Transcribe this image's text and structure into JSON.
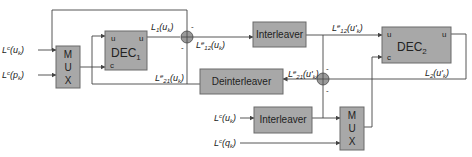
{
  "blocks": {
    "mux1": {
      "letters": [
        "M",
        "U",
        "X"
      ]
    },
    "dec1": {
      "name": "DEC",
      "sub": "1",
      "port_u_in": "u",
      "port_u_out": "u",
      "port_c": "c"
    },
    "interleaver_top": {
      "label": "Interleaver"
    },
    "deinterleaver": {
      "label": "Deinterleaver"
    },
    "dec2": {
      "name": "DEC",
      "sub": "2",
      "port_u_in": "u",
      "port_u_out": "u",
      "port_c": "c"
    },
    "interleaver_bottom": {
      "label": "Interleaver"
    },
    "mux2": {
      "letters": [
        "M",
        "U",
        "X"
      ]
    }
  },
  "signals": {
    "in_uk": {
      "base": "L",
      "sup": "c",
      "arg": "(u",
      "argsub": "k",
      "close": ")"
    },
    "in_pk": {
      "base": "L",
      "sup": "c",
      "arg": "(p",
      "argsub": "k",
      "close": ")"
    },
    "L1": {
      "base": "L",
      "sub": "1",
      "arg": "(u",
      "argsub": "k",
      "close": ")"
    },
    "Le12": {
      "base": "L",
      "sup": "e",
      "sub": "12",
      "arg": "(u",
      "argsub": "k",
      "close": ")"
    },
    "Le21": {
      "base": "L",
      "sup": "e",
      "sub": "21",
      "arg": "(u",
      "argsub": "k",
      "close": ")"
    },
    "Le12p": {
      "base": "L",
      "sup": "e",
      "sub": "12",
      "arg": "(u'",
      "argsub": "k",
      "close": ")"
    },
    "Le21p": {
      "base": "L",
      "sup": "e",
      "sub": "21",
      "arg": "(u'",
      "argsub": "k",
      "close": ")"
    },
    "L2": {
      "base": "L",
      "sub": "2",
      "arg": "(u'",
      "argsub": "k",
      "close": ")"
    },
    "in2_uk": {
      "base": "L",
      "sup": "c",
      "arg": "(u",
      "argsub": "k",
      "close": ")"
    },
    "in2_qk": {
      "base": "L",
      "sup": "c",
      "arg": "(q",
      "argsub": "k",
      "close": ")"
    }
  },
  "summers": {
    "sum1": {
      "signs": [
        "-",
        "-"
      ]
    },
    "sum2": {
      "signs": [
        "-",
        "-"
      ]
    }
  },
  "colors": {
    "block_fill": "#a8a8a8",
    "block_stroke": "#6a6a6a",
    "wire": "#444444"
  }
}
